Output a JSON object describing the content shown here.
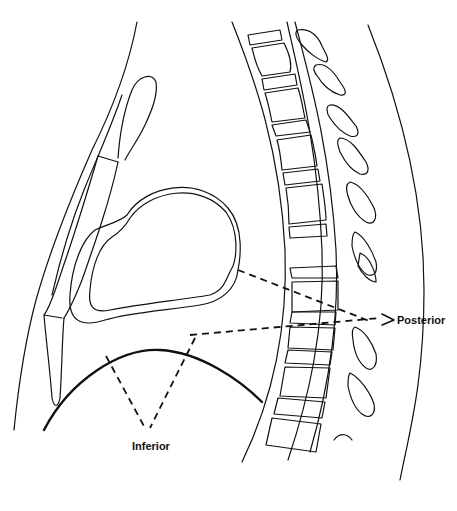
{
  "figure": {
    "type": "sagittal thoracic anatomy line drawing",
    "labels": {
      "posterior": "Posterior",
      "inferior": "Inferior"
    },
    "colors": {
      "line": "#111111",
      "background": "#ffffff"
    }
  }
}
